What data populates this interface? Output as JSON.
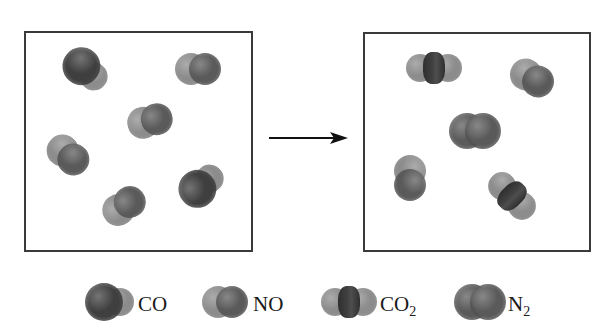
{
  "colors": {
    "carbon": "#3f3f3f",
    "oxygen": "#8c8c8c",
    "nitrogen": "#5a5a5a",
    "box_border": "#3a3a3a",
    "arrow": "#111111"
  },
  "reaction": {
    "before_box": {
      "label": "reactants",
      "molecules": [
        {
          "type": "CO",
          "x": 86,
          "y": 70,
          "angle": 40
        },
        {
          "type": "NO",
          "x": 198,
          "y": 69,
          "angle": 0
        },
        {
          "type": "NO",
          "x": 150,
          "y": 121,
          "angle": -15
        },
        {
          "type": "NO",
          "x": 68,
          "y": 155,
          "angle": 40
        },
        {
          "type": "NO",
          "x": 124,
          "y": 206,
          "angle": -35
        },
        {
          "type": "CO",
          "x": 202,
          "y": 185,
          "angle": -40
        }
      ]
    },
    "arrow": {
      "direction": "right"
    },
    "after_box": {
      "label": "products",
      "molecules": [
        {
          "type": "CO2",
          "x": 434,
          "y": 68,
          "angle": 0
        },
        {
          "type": "NO",
          "x": 532,
          "y": 78,
          "angle": 30
        },
        {
          "type": "N2",
          "x": 475,
          "y": 131,
          "angle": 0
        },
        {
          "type": "NO",
          "x": 410,
          "y": 178,
          "angle": 90
        },
        {
          "type": "CO2",
          "x": 512,
          "y": 196,
          "angle": 45
        }
      ]
    }
  },
  "legend": [
    {
      "type": "CO",
      "label": "CO",
      "sub": ""
    },
    {
      "type": "NO",
      "label": "NO",
      "sub": ""
    },
    {
      "type": "CO2",
      "label": "CO",
      "sub": "2"
    },
    {
      "type": "N2",
      "label": "N",
      "sub": "2"
    }
  ]
}
